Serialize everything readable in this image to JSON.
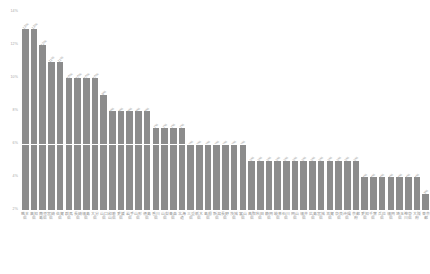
{
  "chart_data": {
    "type": "bar",
    "title": "",
    "subtitle": "",
    "xlabel": "",
    "ylabel": "",
    "ylim": [
      2,
      14
    ],
    "ytick_values": [
      14,
      12,
      10,
      8,
      6,
      4,
      2
    ],
    "ytick_labels": [
      "14%",
      "12%",
      "10%",
      "8%",
      "6%",
      "4%",
      "2%"
    ],
    "grid": true,
    "gridline_values": [
      6
    ],
    "legend": null,
    "orientation": "vertical",
    "sorted": "descending",
    "bar_color": "#8c8c8c",
    "label_color": "#9a9a9a",
    "axis_text_color": "#a8a8a8",
    "categories": [
      "熊本県",
      "高知県",
      "鹿児島県",
      "宮崎県",
      "佐賀県",
      "群馬県",
      "長崎県",
      "福島県",
      "大分県",
      "山口県",
      "和歌山県",
      "愛媛県",
      "岩手県",
      "山形県",
      "徳島県",
      "香川県",
      "山梨県",
      "青森県",
      "北海道",
      "三重県",
      "栃木県",
      "島根県",
      "新潟県",
      "長野県",
      "茨城県",
      "富山県",
      "鳥取県",
      "秋田県",
      "静岡県",
      "岐阜県",
      "石川県",
      "岡山県",
      "福井県",
      "広島県",
      "宮城県",
      "滋賀県",
      "奈良県",
      "沖縄県",
      "京都府",
      "愛知県",
      "千葉県",
      "兵庫県",
      "福岡県",
      "埼玉県",
      "神奈川県",
      "大阪府",
      "東京都"
    ],
    "values": [
      13,
      13,
      12,
      11,
      11,
      10,
      10,
      10,
      10,
      9,
      8,
      8,
      8,
      8,
      8,
      7,
      7,
      7,
      7,
      6,
      6,
      6,
      6,
      6,
      6,
      6,
      5,
      5,
      5,
      5,
      5,
      5,
      5,
      5,
      5,
      5,
      5,
      5,
      5,
      4,
      4,
      4,
      4,
      4,
      4,
      4,
      3
    ],
    "data_labels": [
      "13%",
      "13%",
      "12%",
      "11%",
      "11%",
      "10%",
      "10%",
      "10%",
      "10%",
      "9%",
      "8%",
      "8%",
      "8%",
      "8%",
      "8%",
      "7%",
      "7%",
      "7%",
      "7%",
      "6%",
      "6%",
      "6%",
      "6%",
      "6%",
      "6%",
      "6%",
      "5%",
      "5%",
      "5%",
      "5%",
      "5%",
      "5%",
      "5%",
      "5%",
      "5%",
      "5%",
      "5%",
      "5%",
      "5%",
      "4%",
      "4%",
      "4%",
      "4%",
      "4%",
      "4%",
      "4%",
      "3%"
    ]
  }
}
